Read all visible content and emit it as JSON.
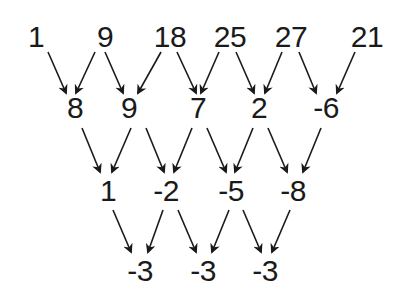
{
  "diagram": {
    "type": "difference-triangle",
    "colors": {
      "ink": "#1a1a1a",
      "background": "#ffffff"
    },
    "rows": [
      {
        "level": 1,
        "top": 22,
        "values": [
          {
            "label": "1",
            "x": 36
          },
          {
            "label": "9",
            "x": 105
          },
          {
            "label": "18",
            "x": 170
          },
          {
            "label": "25",
            "x": 230
          },
          {
            "label": "27",
            "x": 291
          },
          {
            "label": "21",
            "x": 367
          }
        ]
      },
      {
        "level": 2,
        "top": 93,
        "values": [
          {
            "label": "8",
            "x": 75
          },
          {
            "label": "9",
            "x": 129
          },
          {
            "label": "7",
            "x": 198
          },
          {
            "label": "2",
            "x": 259
          },
          {
            "label": "-6",
            "x": 326
          }
        ]
      },
      {
        "level": 3,
        "top": 176,
        "values": [
          {
            "label": "1",
            "x": 108
          },
          {
            "label": "-2",
            "x": 166
          },
          {
            "label": "-5",
            "x": 231
          },
          {
            "label": "-8",
            "x": 293
          }
        ]
      },
      {
        "level": 4,
        "top": 256,
        "values": [
          {
            "label": "-3",
            "x": 140
          },
          {
            "label": "-3",
            "x": 203
          },
          {
            "label": "-3",
            "x": 265
          }
        ]
      }
    ],
    "arrows": [
      {
        "x1": 48,
        "y1": 52,
        "x2": 66,
        "y2": 93
      },
      {
        "x1": 95,
        "y1": 52,
        "x2": 76,
        "y2": 93
      },
      {
        "x1": 105,
        "y1": 52,
        "x2": 123,
        "y2": 93
      },
      {
        "x1": 161,
        "y1": 52,
        "x2": 138,
        "y2": 93
      },
      {
        "x1": 177,
        "y1": 52,
        "x2": 196,
        "y2": 93
      },
      {
        "x1": 219,
        "y1": 52,
        "x2": 201,
        "y2": 93
      },
      {
        "x1": 236,
        "y1": 52,
        "x2": 254,
        "y2": 93
      },
      {
        "x1": 282,
        "y1": 52,
        "x2": 265,
        "y2": 93
      },
      {
        "x1": 299,
        "y1": 52,
        "x2": 316,
        "y2": 93
      },
      {
        "x1": 355,
        "y1": 52,
        "x2": 337,
        "y2": 93
      },
      {
        "x1": 82,
        "y1": 128,
        "x2": 100,
        "y2": 172
      },
      {
        "x1": 131,
        "y1": 128,
        "x2": 112,
        "y2": 172
      },
      {
        "x1": 146,
        "y1": 128,
        "x2": 164,
        "y2": 172
      },
      {
        "x1": 192,
        "y1": 128,
        "x2": 174,
        "y2": 172
      },
      {
        "x1": 207,
        "y1": 128,
        "x2": 226,
        "y2": 172
      },
      {
        "x1": 253,
        "y1": 128,
        "x2": 235,
        "y2": 172
      },
      {
        "x1": 268,
        "y1": 128,
        "x2": 287,
        "y2": 172
      },
      {
        "x1": 321,
        "y1": 128,
        "x2": 303,
        "y2": 172
      },
      {
        "x1": 113,
        "y1": 210,
        "x2": 131,
        "y2": 252
      },
      {
        "x1": 163,
        "y1": 210,
        "x2": 148,
        "y2": 252
      },
      {
        "x1": 178,
        "y1": 210,
        "x2": 196,
        "y2": 252
      },
      {
        "x1": 229,
        "y1": 210,
        "x2": 212,
        "y2": 252
      },
      {
        "x1": 243,
        "y1": 210,
        "x2": 261,
        "y2": 252
      },
      {
        "x1": 290,
        "y1": 210,
        "x2": 272,
        "y2": 252
      }
    ]
  }
}
